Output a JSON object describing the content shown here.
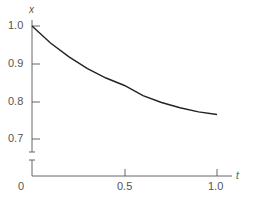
{
  "chart_data": {
    "type": "line",
    "title": "",
    "xlabel": "t",
    "ylabel": "x",
    "xlim": [
      0,
      1.05
    ],
    "ylim": [
      0.7,
      1.0
    ],
    "y_axis_break": true,
    "grid": false,
    "x_ticks": [
      "0",
      "0.5",
      "1.0"
    ],
    "y_ticks": [
      "1.0",
      "0.9",
      "0.8",
      "0.7"
    ],
    "series": [
      {
        "name": "x(t)",
        "x": [
          0,
          0.1,
          0.2,
          0.3,
          0.4,
          0.5,
          0.6,
          0.7,
          0.8,
          0.9,
          1.0
        ],
        "values": [
          1.0,
          0.955,
          0.918,
          0.887,
          0.862,
          0.842,
          0.815,
          0.797,
          0.783,
          0.772,
          0.765
        ]
      }
    ],
    "color": "#222222"
  },
  "labels": {
    "y_axis": "x",
    "x_axis": "t",
    "origin": "0",
    "y1": "1.0",
    "y09": "0.9",
    "y08": "0.8",
    "y07": "0.7",
    "x05": "0.5",
    "x10": "1.0"
  }
}
